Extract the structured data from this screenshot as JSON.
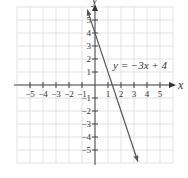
{
  "chart_data": {
    "type": "line",
    "title": "",
    "xlabel": "x",
    "ylabel": "y",
    "xlim": [
      -6,
      6
    ],
    "ylim": [
      -6,
      6
    ],
    "grid": true,
    "x_ticks": [
      -5,
      -4,
      -3,
      -2,
      -1,
      1,
      2,
      3,
      4,
      5
    ],
    "y_ticks": [
      -5,
      -4,
      -3,
      -2,
      -1,
      1,
      2,
      3,
      4,
      5
    ],
    "x_tick_labels": [
      "−5",
      "−4",
      "−3",
      "−2",
      "−1",
      "1",
      "2",
      "3",
      "4",
      "5"
    ],
    "y_tick_labels": [
      "−5",
      "−4",
      "−3",
      "−2",
      "−1",
      "1",
      "2",
      "3",
      "4",
      "5"
    ],
    "series": [
      {
        "name": "y = −3x + 4",
        "equation": "y = -3x + 4",
        "slope": -3,
        "intercept": 4,
        "x": [
          -0.6,
          3.3
        ],
        "y": [
          5.8,
          -5.9
        ],
        "color": "#555555",
        "arrows": "both"
      }
    ],
    "annotations": [
      {
        "text": "y = −3x + 4",
        "x": 1.8,
        "y": 1.5
      }
    ]
  },
  "labels": {
    "x_axis": "x",
    "y_axis": "y",
    "equation": "y = −3x + 4"
  }
}
